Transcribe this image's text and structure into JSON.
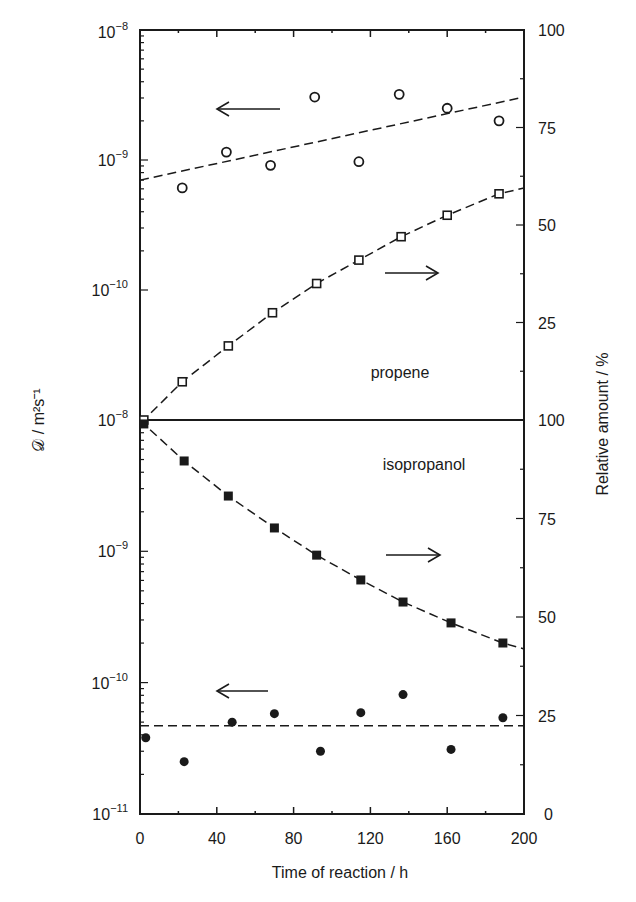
{
  "chart_data": {
    "type": "scatter",
    "title": "",
    "xlabel": "Time of reaction / h",
    "xlim": [
      0,
      200
    ],
    "xticks": [
      0,
      40,
      80,
      120,
      160,
      200
    ],
    "grid": false,
    "legend": "none (arrows indicate axis)",
    "panels": [
      {
        "name": "propene",
        "label": "propene",
        "ylabel_left": "𝒟 / m²s⁻¹",
        "yscale_left": "log",
        "ylim_left": [
          1e-10,
          1e-08
        ],
        "yticks_left": [
          "10^-10",
          "10^-9",
          "10^-8"
        ],
        "ylabel_right": "Relative amount / %",
        "ylim_right": [
          0,
          100
        ],
        "yticks_right": [
          0,
          25,
          50,
          75,
          100
        ],
        "series": [
          {
            "name": "propene diffusivity",
            "axis": "left",
            "marker": "open-circle",
            "x": [
              22,
              45,
              68,
              91,
              114,
              135,
              160,
              187
            ],
            "y": [
              6.1e-10,
              1.15e-09,
              9.1e-10,
              3.05e-09,
              9.7e-10,
              3.2e-09,
              2.5e-09,
              2e-09
            ],
            "fit": {
              "style": "dashed",
              "x": [
                0,
                200
              ],
              "y": [
                7e-10,
                3.05e-09
              ]
            },
            "arrow": "left"
          },
          {
            "name": "propene relative amount",
            "axis": "right",
            "marker": "open-square",
            "x": [
              2,
              22,
              46,
              69,
              92,
              114,
              136,
              160,
              187
            ],
            "y": [
              0,
              9.8,
              19,
              27.5,
              35,
              41,
              47,
              52.5,
              58
            ],
            "fit": {
              "style": "dashed",
              "x": [
                0,
                200
              ],
              "y": [
                0,
                59.5
              ]
            },
            "arrow": "right"
          }
        ]
      },
      {
        "name": "isopropanol",
        "label": "isopropanol",
        "ylabel_left": "𝒟 / m²s⁻¹",
        "yscale_left": "log",
        "ylim_left": [
          1e-11,
          1e-08
        ],
        "yticks_left": [
          "10^-11",
          "10^-10",
          "10^-9",
          "10^-8"
        ],
        "ylabel_right": "Relative amount / %",
        "ylim_right": [
          0,
          100
        ],
        "yticks_right": [
          0,
          25,
          50,
          75,
          100
        ],
        "series": [
          {
            "name": "isopropanol relative amount",
            "axis": "right",
            "marker": "filled-square",
            "x": [
              2,
              23,
              46,
              70,
              92,
              115,
              137,
              162,
              189
            ],
            "y": [
              99,
              89.6,
              80.7,
              72.6,
              65.7,
              59.4,
              53.8,
              48.5,
              43.4
            ],
            "fit": {
              "style": "dashed-curve",
              "x_end": 200,
              "y_end": 41.9
            },
            "arrow": "right"
          },
          {
            "name": "isopropanol diffusivity",
            "axis": "left",
            "marker": "filled-circle",
            "x": [
              3,
              23,
              48,
              70,
              94,
              115,
              137,
              162,
              189
            ],
            "y": [
              3.8e-11,
              2.5e-11,
              5e-11,
              5.8e-11,
              3e-11,
              5.9e-11,
              8.1e-11,
              3.1e-11,
              5.4e-11
            ],
            "fit": {
              "style": "dashed",
              "x": [
                0,
                200
              ],
              "y": [
                4.7e-11,
                4.7e-11
              ]
            },
            "arrow": "left"
          }
        ]
      }
    ]
  },
  "labels": {
    "x_axis_title": "Time of reaction / h",
    "left_axis_title": "𝒟 / m²s⁻¹",
    "right_axis_title": "Relative amount / %",
    "propene": "propene",
    "isopropanol": "isopropanol",
    "x_ticks": [
      "0",
      "40",
      "80",
      "120",
      "160",
      "200"
    ],
    "right_ticks_top": [
      "100",
      "75",
      "50",
      "25"
    ],
    "right_ticks_bottom": [
      "100",
      "75",
      "50",
      "25",
      "0"
    ]
  }
}
